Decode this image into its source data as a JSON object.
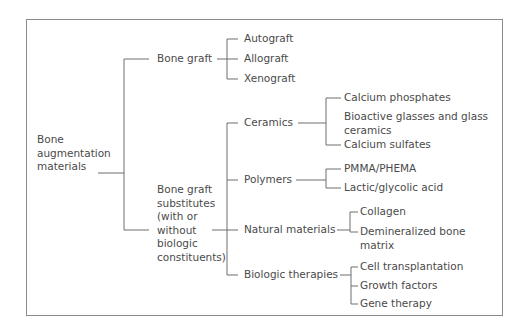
{
  "diagram": {
    "root": {
      "label_lines": [
        "Bone",
        "augmentation",
        "materials"
      ]
    },
    "branches": [
      {
        "label": "Bone graft",
        "children": [
          "Autograft",
          "Allograft",
          "Xenograft"
        ]
      },
      {
        "label_lines": [
          "Bone graft",
          "substitutes",
          "(with or",
          "without",
          "biologic",
          "constituents)"
        ],
        "groups": [
          {
            "label": "Ceramics",
            "children": [
              "Calcium phosphates",
              "Bioactive glasses and glass",
              "ceramics",
              "Calcium sulfates"
            ]
          },
          {
            "label": "Polymers",
            "children": [
              "PMMA/PHEMA",
              "Lactic/glycolic acid"
            ]
          },
          {
            "label": "Natural materials",
            "children": [
              "Collagen",
              "Demineralized bone",
              "matrix"
            ]
          },
          {
            "label": "Biologic therapies",
            "children": [
              "Cell transplantation",
              "Growth factors",
              "Gene therapy"
            ]
          }
        ]
      }
    ]
  }
}
